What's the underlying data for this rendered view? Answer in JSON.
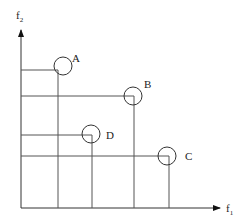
{
  "axes": {
    "x_label": "f",
    "x_sub": "1",
    "y_label": "f",
    "y_sub": "2"
  },
  "points": [
    {
      "label": "A",
      "x": 58,
      "y": 70
    },
    {
      "label": "B",
      "x": 134,
      "y": 96
    },
    {
      "label": "D",
      "x": 92,
      "y": 135
    },
    {
      "label": "C",
      "x": 169,
      "y": 156
    }
  ],
  "colors": {
    "line": "#444444",
    "text": "#222222"
  }
}
